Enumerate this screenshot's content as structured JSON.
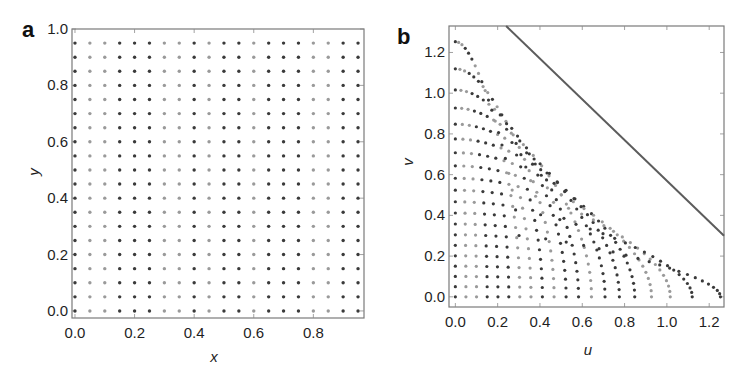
{
  "chart_data": [
    {
      "panel": "a",
      "type": "scatter",
      "title": "",
      "xlabel": "x",
      "ylabel": "y",
      "xlim": [
        -0.01,
        0.97
      ],
      "ylim": [
        -0.025,
        1.0
      ],
      "x_ticks": [
        "0.0",
        "0.2",
        "0.4",
        "0.6",
        "0.8"
      ],
      "x_tick_values": [
        0.0,
        0.2,
        0.4,
        0.6,
        0.8
      ],
      "y_ticks": [
        "0.0",
        "0.2",
        "0.4",
        "0.6",
        "0.8",
        "1.0"
      ],
      "y_tick_values": [
        0.0,
        0.2,
        0.4,
        0.6,
        0.8,
        1.0
      ],
      "grid": false,
      "points_description": "uniform 20x20 grid, x and y from 0.00 to 0.95 in steps of 0.05",
      "grid_values": [
        0.0,
        0.05,
        0.1,
        0.15,
        0.2,
        0.25,
        0.3,
        0.35,
        0.4,
        0.45,
        0.5,
        0.55,
        0.6,
        0.65,
        0.7,
        0.75,
        0.8,
        0.85,
        0.9,
        0.95
      ]
    },
    {
      "panel": "b",
      "type": "scatter",
      "title": "",
      "xlabel": "u",
      "ylabel": "v",
      "xlim": [
        -0.03,
        1.27
      ],
      "ylim": [
        -0.05,
        1.33
      ],
      "x_ticks": [
        "0.0",
        "0.2",
        "0.4",
        "0.6",
        "0.8",
        "1.0",
        "1.2"
      ],
      "x_tick_values": [
        0.0,
        0.2,
        0.4,
        0.6,
        0.8,
        1.0,
        1.2
      ],
      "y_ticks": [
        "0.0",
        "0.2",
        "0.4",
        "0.6",
        "0.8",
        "1.0",
        "1.2"
      ],
      "y_tick_values": [
        0.0,
        0.2,
        0.4,
        0.6,
        0.8,
        1.0,
        1.2
      ],
      "grid": false,
      "points_description": "transformed grid: u = asin(x*sqrt(1-y^2)), v = asin(y*sqrt(1-x^2)) for the 20x20 grid of panel a",
      "boundary_line": {
        "equation": "u + v = pi/2",
        "from": [
          0.24,
          1.33
        ],
        "to": [
          1.27,
          0.3
        ]
      },
      "axis_max_points": {
        "u_at_v0": 1.25,
        "v_at_u0": 1.25
      }
    }
  ],
  "panels": {
    "a": {
      "label": "a"
    },
    "b": {
      "label": "b"
    }
  },
  "colors": {
    "dot_dark": "#3a3a3a",
    "dot_light": "#9a9a9a",
    "frame": "#7a7a7a",
    "line": "#5c5c5c"
  }
}
